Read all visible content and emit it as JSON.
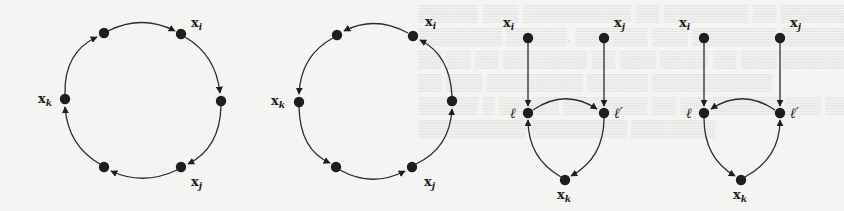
{
  "figure": {
    "colors": {
      "ink": "#1e1e1e",
      "background": "#f4f4f2"
    },
    "graphs": [
      {
        "id": "cycle-clockwise",
        "labels": {
          "xi": "x",
          "xi_sub": "i",
          "xj": "x",
          "xj_sub": "j",
          "xk": "x",
          "xk_sub": "k"
        },
        "edges": [
          "n-top-left→x_i",
          "x_i→n-right",
          "n-right→x_j",
          "x_j→n-bottom-left",
          "n-bottom-left→x_k",
          "x_k→n-top-left"
        ]
      },
      {
        "id": "cycle-counterclockwise",
        "labels": {
          "xi": "x",
          "xi_sub": "i",
          "xj": "x",
          "xj_sub": "j",
          "xk": "x",
          "xk_sub": "k"
        },
        "edges": [
          "x_i→n-top-left",
          "n-top-left→x_k",
          "x_k→n-bottom-left",
          "n-bottom-left→x_j",
          "x_j→n-right",
          "n-right→x_i"
        ]
      },
      {
        "id": "gadget-a",
        "labels": {
          "xi": "x",
          "xi_sub": "i",
          "xj": "x",
          "xj_sub": "j",
          "xk": "x",
          "xk_sub": "k",
          "l": "ℓ",
          "lp": "ℓ′"
        },
        "edges": [
          "x_i→ℓ",
          "x_j→ℓ′",
          "ℓ→ℓ′",
          "ℓ′→x_k",
          "x_k→ℓ"
        ]
      },
      {
        "id": "gadget-b",
        "labels": {
          "xi": "x",
          "xi_sub": "i",
          "xj": "x",
          "xj_sub": "j",
          "xk": "x",
          "xk_sub": "k",
          "l": "ℓ",
          "lp": "ℓ′"
        },
        "edges": [
          "x_i→ℓ",
          "x_j→ℓ′",
          "ℓ′→ℓ",
          "ℓ→x_k",
          "x_k→ℓ′"
        ]
      }
    ]
  }
}
